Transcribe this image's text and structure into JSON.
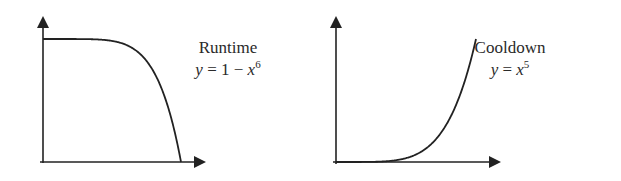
{
  "chart_data": [
    {
      "type": "line",
      "title": "Runtime",
      "equation": "y = 1 − x^6",
      "equation_parts": {
        "lhs": "y",
        "eq": " = 1 − ",
        "var": "x",
        "exp": "6"
      },
      "xlabel": "",
      "ylabel": "",
      "xlim": [
        0,
        1
      ],
      "ylim": [
        0,
        1
      ],
      "grid": false,
      "ticks": false,
      "x": [
        0,
        0.2,
        0.4,
        0.6,
        0.8,
        0.9,
        1.0
      ],
      "values": [
        1,
        0.99994,
        0.9959,
        0.9533,
        0.7379,
        0.4686,
        0
      ]
    },
    {
      "type": "line",
      "title": "Cooldown",
      "equation": "y = x^5",
      "equation_parts": {
        "lhs": "y",
        "eq": " = ",
        "var": "x",
        "exp": "5"
      },
      "xlabel": "",
      "ylabel": "",
      "xlim": [
        0,
        1
      ],
      "ylim": [
        0,
        1
      ],
      "grid": false,
      "ticks": false,
      "x": [
        0,
        0.2,
        0.4,
        0.6,
        0.8,
        0.9,
        1.0
      ],
      "values": [
        0,
        0.00032,
        0.01024,
        0.07776,
        0.32768,
        0.59049,
        1
      ]
    }
  ],
  "colors": {
    "axis": "#222222",
    "curve": "#222222"
  }
}
